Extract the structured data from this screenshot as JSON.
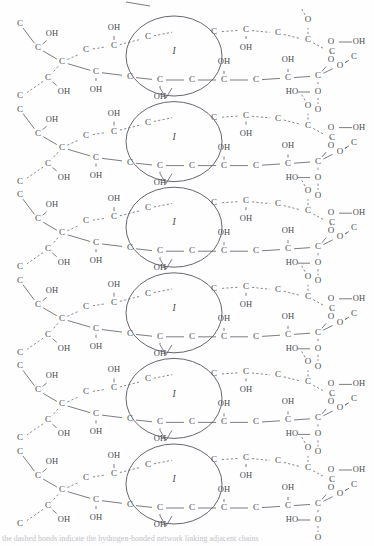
{
  "figure": {
    "type": "chemical-structure",
    "background_color": "#fefefe",
    "line_color": "#64646e",
    "text_color": "#4a4a52",
    "units": 6,
    "unit_period_px": 85.6,
    "first_unit_center_y": 62,
    "ring_label": "I",
    "atom_labels": {
      "carbon": "C",
      "oxygen": "O"
    },
    "group_labels": {
      "hydroxyl": "OH",
      "hydroxyl_reversed": "HO",
      "peroxy_terminal": "OH"
    },
    "caption": "the dashed bonds indicate the hydrogen-bonded network linking adjacent chains"
  },
  "chart_data": {
    "type": "diagram",
    "xlabel": "",
    "ylabel": "",
    "repeat_count": 6,
    "ring_labels": [
      "I",
      "I",
      "I",
      "I",
      "I",
      "I"
    ],
    "ring_centers_y": [
      62,
      148,
      233,
      319,
      404,
      490
    ],
    "ring_center_x": 174,
    "ring_radius_x": 48,
    "ring_radius_y": 40,
    "atoms_per_unit": {
      "C": 18,
      "O": 5,
      "OH": 9,
      "HO": 1
    },
    "legend": [],
    "annotations": [
      "I"
    ]
  },
  "unit_template": {
    "solid_backbone": [
      {
        "label": "C",
        "x": 30,
        "y": 46
      },
      {
        "label": "C",
        "x": 38,
        "y": 57
      },
      {
        "label": "C",
        "x": 58,
        "y": 62
      },
      {
        "label": "C",
        "x": 88,
        "y": 62
      },
      {
        "label": "C",
        "x": 118,
        "y": 62
      },
      {
        "label": "C",
        "x": 148,
        "y": 62
      },
      {
        "label": "C",
        "x": 174,
        "y": 62
      },
      {
        "label": "C",
        "x": 204,
        "y": 62
      },
      {
        "label": "C",
        "x": 232,
        "y": 62
      },
      {
        "label": "C",
        "x": 262,
        "y": 62
      },
      {
        "label": "C",
        "x": 290,
        "y": 62
      },
      {
        "label": "C",
        "x": 316,
        "y": 55
      }
    ],
    "dashed_backbone": [
      {
        "label": "C",
        "x": 18,
        "y": 32
      },
      {
        "label": "C",
        "x": 38,
        "y": 35
      },
      {
        "label": "C",
        "x": 58,
        "y": 40
      },
      {
        "label": "C",
        "x": 68,
        "y": 42
      },
      {
        "label": "C",
        "x": 88,
        "y": 37
      },
      {
        "label": "C",
        "x": 118,
        "y": 35
      },
      {
        "label": "C",
        "x": 148,
        "y": 32
      },
      {
        "label": "C",
        "x": 232,
        "y": 30
      },
      {
        "label": "C",
        "x": 262,
        "y": 30
      },
      {
        "label": "C",
        "x": 290,
        "y": 33
      }
    ],
    "hydroxyls": [
      {
        "label": "OH",
        "x": 52,
        "y": 42
      },
      {
        "label": "OH",
        "x": 58,
        "y": 80
      },
      {
        "label": "OH",
        "x": 88,
        "y": 18
      },
      {
        "label": "OH",
        "x": 88,
        "y": 80
      },
      {
        "label": "OH",
        "x": 148,
        "y": 18
      },
      {
        "label": "OH",
        "x": 148,
        "y": 84
      },
      {
        "label": "OH",
        "x": 204,
        "y": 44
      },
      {
        "label": "OH",
        "x": 262,
        "y": 44
      },
      {
        "label": "OH",
        "x": 262,
        "y": 82
      }
    ],
    "oxygens": [
      {
        "label": "O",
        "x": 310,
        "y": 22
      },
      {
        "label": "O",
        "x": 330,
        "y": 72
      },
      {
        "label": "O",
        "x": 330,
        "y": 96
      },
      {
        "label": "O",
        "x": 318,
        "y": 116
      },
      {
        "label": "O",
        "x": 344,
        "y": 118
      },
      {
        "label": "O",
        "x": 326,
        "y": 152
      },
      {
        "label": "O",
        "x": 326,
        "y": 176
      }
    ],
    "terminal_groups": [
      {
        "label": "OH",
        "x": 356,
        "y": 96
      },
      {
        "label": "HO",
        "x": 300,
        "y": 152
      }
    ]
  }
}
